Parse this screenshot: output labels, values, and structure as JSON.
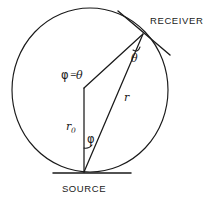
{
  "figure": {
    "background_color": "#ffffff",
    "line_color": "#1a1a1a",
    "width": 206,
    "height": 201
  },
  "labels": {
    "receiver": "RECEIVER",
    "source": "SOURCE",
    "phi_equals_theta": "φ = θ",
    "phi_symbol": "φ",
    "theta_symbol": "θ",
    "equals_symbol": "=",
    "r_zero_base": "r",
    "r_zero_subscript": "0",
    "r_label": "r"
  },
  "geometry": {
    "circle": {
      "center_x": 90,
      "center_y": 90,
      "radius_x": 78,
      "radius_y": 82
    },
    "source_point": {
      "x": 84,
      "y": 172
    },
    "receiver_point": {
      "x": 143,
      "y": 34
    },
    "apex_point": {
      "x": 84,
      "y": 88
    },
    "ground_line": {
      "x1": 54,
      "y1": 173,
      "x2": 130,
      "y2": 173
    },
    "tangent_line": {
      "x1": 119,
      "y1": 12,
      "x2": 168,
      "y2": 54
    }
  },
  "annotations": {
    "angle_theta_at_receiver": "θ",
    "angle_phi_at_source": "φ",
    "relation": "φ = θ",
    "radius_from_source": "r₀",
    "chord_to_receiver": "r"
  }
}
